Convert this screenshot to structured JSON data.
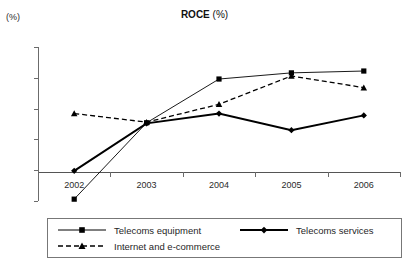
{
  "chart_data": {
    "type": "line",
    "title": "ROCE (%)",
    "title_main": "ROCE",
    "title_suffix": " (%)",
    "xlabel": "",
    "ylabel": "(%)",
    "yunit_label": "(%)",
    "categories": [
      "2002",
      "2003",
      "2004",
      "2005",
      "2006"
    ],
    "x": [
      2002,
      2003,
      2004,
      2005,
      2006
    ],
    "ylim": [
      -5,
      20
    ],
    "yticks": [
      -5,
      0,
      5,
      10,
      15,
      20
    ],
    "ytick_labels": [
      "-5",
      "0",
      "5",
      "10",
      "15",
      "20"
    ],
    "grid": false,
    "legend_position": "bottom",
    "series": [
      {
        "name": "Telecoms equipment",
        "marker": "square",
        "line_style": "solid",
        "line_width": "thin",
        "color": "#000000",
        "values": [
          -4.7,
          7.7,
          14.8,
          15.8,
          16.1
        ]
      },
      {
        "name": "Telecoms services",
        "marker": "diamond",
        "line_style": "solid",
        "line_width": "thick",
        "color": "#000000",
        "values": [
          -0.1,
          7.6,
          9.2,
          6.5,
          8.9
        ]
      },
      {
        "name": "Internet and e-commerce",
        "marker": "triangle",
        "line_style": "dashed",
        "line_width": "medium",
        "color": "#000000",
        "values": [
          9.2,
          7.8,
          10.7,
          15.3,
          13.4
        ]
      }
    ]
  },
  "legend": {
    "items": [
      {
        "label": "Telecoms equipment",
        "marker": "square",
        "style": "solid-thin"
      },
      {
        "label": "Telecoms services",
        "marker": "diamond",
        "style": "solid-thick"
      },
      {
        "label": "Internet and e-commerce",
        "marker": "triangle",
        "style": "dashed"
      }
    ]
  },
  "footer": {
    "cropped_text": ""
  }
}
